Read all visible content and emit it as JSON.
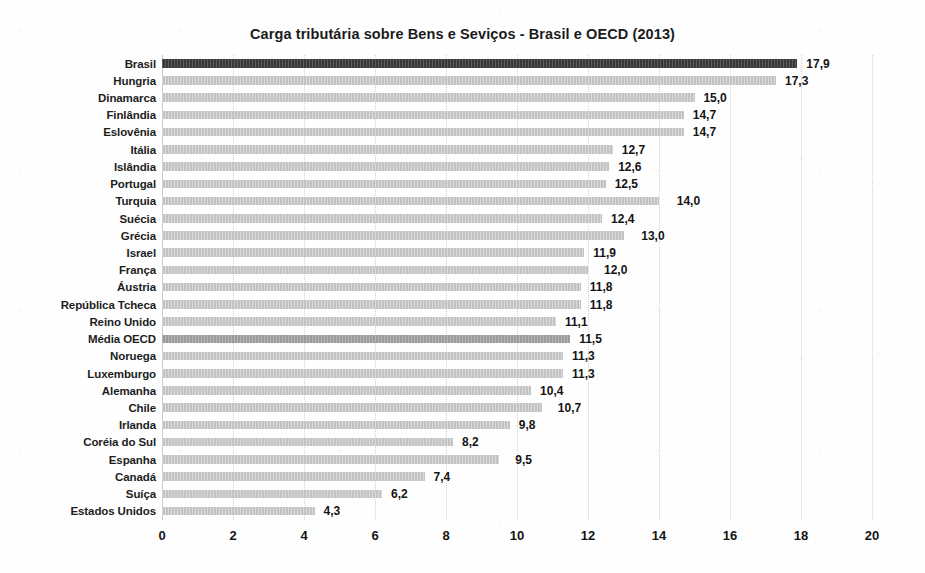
{
  "chart_data": {
    "type": "bar",
    "orientation": "horizontal",
    "title": "Carga tributária sobre Bens e Seviços - Brasil e OECD (2013)",
    "xlabel": "",
    "ylabel": "",
    "xlim": [
      0,
      20
    ],
    "xticks": [
      0,
      2,
      4,
      6,
      8,
      10,
      12,
      14,
      16,
      18,
      20
    ],
    "xtick_labels": [
      "0",
      "2",
      "4",
      "6",
      "8",
      "10",
      "12",
      "14",
      "16",
      "18",
      "20"
    ],
    "grid": true,
    "grid_axis": "x",
    "grid_style": "dotted",
    "legend": false,
    "decimal_separator": ",",
    "colors": {
      "bar_default": "#c3c3c3",
      "bar_highlight_dark": "#3a3a3a",
      "bar_highlight_mid": "#9a9a9a",
      "gridline": "#d2d2d2",
      "text": "#141414",
      "background": "#ffffff"
    },
    "categories": [
      "Brasil",
      "Hungria",
      "Dinamarca",
      "Finlândia",
      "Eslovênia",
      "Itália",
      "Islândia",
      "Portugal",
      "Turquia",
      "Suécia",
      "Grécia",
      "Israel",
      "França",
      "Áustria",
      "República Tcheca",
      "Reino Unido",
      "Média OECD",
      "Noruega",
      "Luxemburgo",
      "Alemanha",
      "Chile",
      "Irlanda",
      "Coréia do Sul",
      "Espanha",
      "Canadá",
      "Suíça",
      "Estados Unidos"
    ],
    "values": [
      17.9,
      17.3,
      15.0,
      14.7,
      14.7,
      12.7,
      12.6,
      12.5,
      14.0,
      12.4,
      13.0,
      11.9,
      12.0,
      11.8,
      11.8,
      11.1,
      11.5,
      11.3,
      11.3,
      10.4,
      10.7,
      9.8,
      8.2,
      9.5,
      7.4,
      6.2,
      4.3
    ],
    "value_labels": [
      "17,9",
      "17,3",
      "15,0",
      "14,7",
      "14,7",
      "12,7",
      "12,6",
      "12,5",
      "14,0",
      "12,4",
      "13,0",
      "11,9",
      "12,0",
      "11,8",
      "11,8",
      "11,1",
      "11,5",
      "11,3",
      "11,3",
      "10,4",
      "10,7",
      "9,8",
      "8,2",
      "9,5",
      "7,4",
      "6,2",
      "4,3"
    ],
    "bar_styles": [
      "highlight-dark",
      "default",
      "default",
      "default",
      "default",
      "default",
      "default",
      "default",
      "default",
      "default",
      "default",
      "default",
      "default",
      "default",
      "default",
      "default",
      "highlight-mid",
      "default",
      "default",
      "default",
      "default",
      "default",
      "default",
      "default",
      "default",
      "default",
      "default"
    ],
    "label_offsets": [
      0.25,
      0.25,
      0.25,
      0.25,
      0.25,
      0.25,
      0.25,
      0.25,
      0.5,
      0.25,
      0.5,
      0.25,
      0.45,
      0.25,
      0.25,
      0.25,
      0.25,
      0.25,
      0.25,
      0.25,
      0.45,
      0.25,
      0.25,
      0.45,
      0.25,
      0.25,
      0.25
    ]
  }
}
